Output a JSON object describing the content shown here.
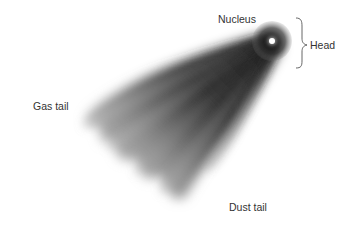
{
  "diagram": {
    "labels": {
      "nucleus": "Nucleus",
      "head": "Head",
      "gas_tail": "Gas tail",
      "dust_tail": "Dust tail"
    },
    "colors": {
      "background": "#ffffff",
      "tail_dark": "#1a1a1a",
      "tail_light": "#d8d8d8",
      "nucleus": "#ffffff",
      "text": "#333333",
      "brace": "#555555"
    },
    "nucleus_position": {
      "x": 272,
      "y": 41
    }
  }
}
